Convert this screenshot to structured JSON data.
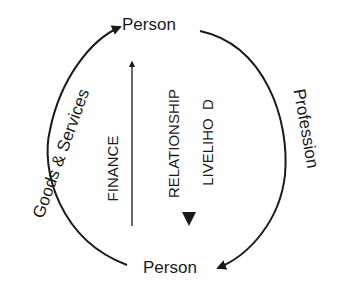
{
  "diagram": {
    "nodes": {
      "top": "Person",
      "bottom": "Person"
    },
    "edges": {
      "left": "Goods & Services",
      "right": "Profession"
    },
    "center": {
      "finance": "FINANCE",
      "relationship": "RELATIONSHIP",
      "livelihood": "LIVELIHO  D"
    },
    "colors": {
      "ink": "#1a1a1a",
      "background": "#ffffff"
    }
  }
}
